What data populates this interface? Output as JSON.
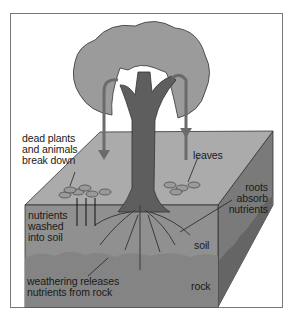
{
  "diagram": {
    "type": "nutrient cycle in soil",
    "style": "grayscale illustration, isometric soil block with tree",
    "labels": {
      "dead_plants": [
        "dead plants",
        "and animals",
        "break down"
      ],
      "leaves": [
        "leaves"
      ],
      "nutrients_washed": [
        "nutrients",
        "washed",
        "into soil"
      ],
      "roots_absorb": [
        "roots",
        "absorb",
        "nutrients"
      ],
      "soil": [
        "soil"
      ],
      "weathering": [
        "weathering releases",
        "nutrients from rock"
      ],
      "rock": [
        "rock"
      ]
    },
    "colors": {
      "canopy": "#9a9a9a",
      "trunk": "#5e5e5e",
      "arrow": "#6b6b6b",
      "top_face": "#a8a8a8",
      "front_soil": "#8e8e8e",
      "front_rock": "#858585",
      "side_face": "#6f6f6f",
      "frame": "#777777"
    }
  }
}
